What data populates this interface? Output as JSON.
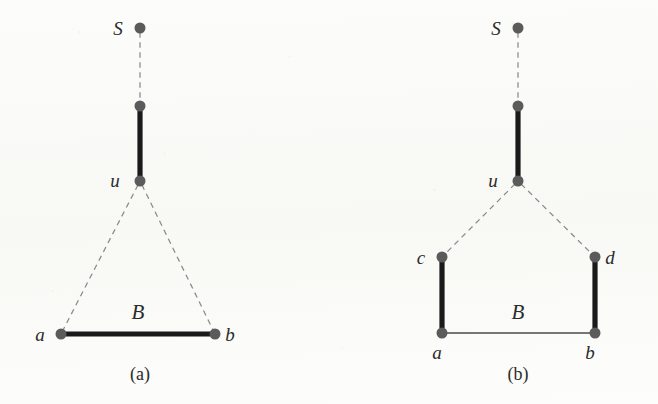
{
  "figure": {
    "kind": "graph-diagram",
    "background_color": "#fbfbf9",
    "node_color": "#5b5b5b",
    "edge_color_solid": "#1a1a1a",
    "edge_color_thin": "#4a4a4a",
    "edge_color_dashed": "#8a8a8a",
    "node_radius": 5.5,
    "subfigures": [
      {
        "id": "a",
        "caption": "(a)",
        "caption_pos": {
          "x": 140,
          "y": 380
        },
        "nodes": [
          {
            "id": "S",
            "label": "S",
            "x": 140,
            "y": 28,
            "label_x": 118,
            "label_y": 35,
            "labeled": true
          },
          {
            "id": "m1",
            "label": "",
            "x": 140,
            "y": 106,
            "label_x": 0,
            "label_y": 0,
            "labeled": false
          },
          {
            "id": "u",
            "label": "u",
            "x": 140,
            "y": 181,
            "label_x": 115,
            "label_y": 187,
            "labeled": true
          },
          {
            "id": "a",
            "label": "a",
            "x": 61,
            "y": 334,
            "label_x": 40,
            "label_y": 341,
            "labeled": true
          },
          {
            "id": "b",
            "label": "b",
            "x": 215,
            "y": 334,
            "label_x": 230,
            "label_y": 341,
            "labeled": true
          }
        ],
        "edges": [
          {
            "from": "S",
            "to": "m1",
            "style": "dashed",
            "label": ""
          },
          {
            "from": "m1",
            "to": "u",
            "style": "thick",
            "label": ""
          },
          {
            "from": "u",
            "to": "a",
            "style": "dashed",
            "label": ""
          },
          {
            "from": "u",
            "to": "b",
            "style": "dashed",
            "label": ""
          },
          {
            "from": "a",
            "to": "b",
            "style": "thick",
            "label": "B",
            "label_x": 138,
            "label_y": 319
          }
        ]
      },
      {
        "id": "b",
        "caption": "(b)",
        "caption_pos": {
          "x": 518,
          "y": 380
        },
        "nodes": [
          {
            "id": "S",
            "label": "S",
            "x": 518,
            "y": 28,
            "label_x": 496,
            "label_y": 35,
            "labeled": true
          },
          {
            "id": "m1",
            "label": "",
            "x": 518,
            "y": 106,
            "label_x": 0,
            "label_y": 0,
            "labeled": false
          },
          {
            "id": "u",
            "label": "u",
            "x": 518,
            "y": 181,
            "label_x": 493,
            "label_y": 187,
            "labeled": true
          },
          {
            "id": "c",
            "label": "c",
            "x": 442,
            "y": 257,
            "label_x": 421,
            "label_y": 264,
            "labeled": true
          },
          {
            "id": "d",
            "label": "d",
            "x": 595,
            "y": 257,
            "label_x": 610,
            "label_y": 264,
            "labeled": true
          },
          {
            "id": "a",
            "label": "a",
            "x": 442,
            "y": 333,
            "label_x": 437,
            "label_y": 359,
            "labeled": true
          },
          {
            "id": "b",
            "label": "b",
            "x": 595,
            "y": 333,
            "label_x": 590,
            "label_y": 359,
            "labeled": true
          }
        ],
        "edges": [
          {
            "from": "S",
            "to": "m1",
            "style": "dashed",
            "label": ""
          },
          {
            "from": "m1",
            "to": "u",
            "style": "thick",
            "label": ""
          },
          {
            "from": "u",
            "to": "c",
            "style": "dashed",
            "label": ""
          },
          {
            "from": "u",
            "to": "d",
            "style": "dashed",
            "label": ""
          },
          {
            "from": "c",
            "to": "a",
            "style": "thick",
            "label": ""
          },
          {
            "from": "d",
            "to": "b",
            "style": "thick",
            "label": ""
          },
          {
            "from": "a",
            "to": "b",
            "style": "thin",
            "label": "B",
            "label_x": 518,
            "label_y": 319
          }
        ]
      }
    ]
  }
}
